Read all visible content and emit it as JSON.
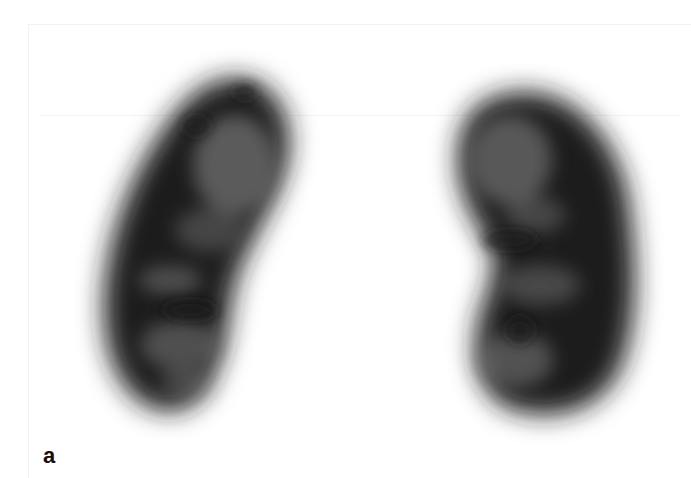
{
  "figure": {
    "panel_label": "a",
    "background": "#ffffff",
    "subjects": [
      {
        "name": "left-kidney",
        "orientation": "tilted, upper pole toward right"
      },
      {
        "name": "right-kidney",
        "orientation": "bean shape, hilum facing left"
      }
    ]
  }
}
